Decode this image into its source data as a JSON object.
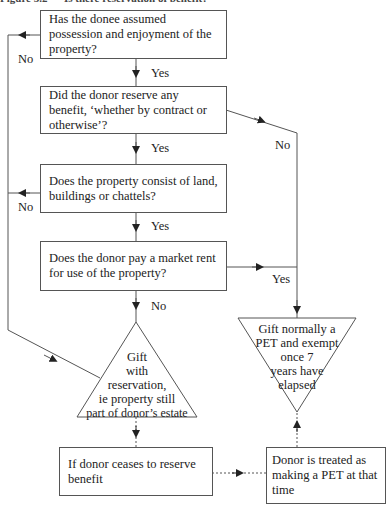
{
  "title": "Figure 3.2 — Is there reservation of benefit?",
  "boxes": {
    "q1": "Has the donee assumed possession and enjoyment of the property?",
    "q2": "Did the donor reserve any benefit, ‘whether by contract or otherwise’?",
    "q3": "Does the property consist of land, buildings or chattels?",
    "q4": "Does the donor pay a market rent for use of the property?",
    "ceases": "If donor ceases to reserve benefit",
    "treated": "Donor is treated as making a PET at that time"
  },
  "triangles": {
    "reservation": [
      "Gift",
      "with",
      "reservation,",
      "ie property still",
      "part of donor’s estate"
    ],
    "pet": [
      "Gift normally a",
      "PET and exempt",
      "once 7",
      "years have",
      "elapsed"
    ]
  },
  "labels": {
    "q1_yes": "Yes",
    "q1_no": "No",
    "q2_yes": "Yes",
    "q2_no": "No",
    "q3_yes": "Yes",
    "q3_no": "No",
    "q4_yes": "Yes",
    "q4_no": "No"
  },
  "colors": {
    "line": "#555555",
    "text": "#222222"
  }
}
